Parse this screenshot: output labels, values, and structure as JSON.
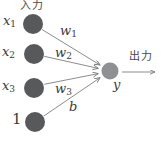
{
  "diagram": {
    "title_semantics": "perceptron neuron diagram",
    "input_label": "入力",
    "output_label": "出力",
    "nodes": [
      {
        "id": "x1",
        "base": "x",
        "sub": "1"
      },
      {
        "id": "x2",
        "base": "x",
        "sub": "2"
      },
      {
        "id": "x3",
        "base": "x",
        "sub": "3"
      },
      {
        "id": "bias-input",
        "base": "1",
        "sub": ""
      },
      {
        "id": "y",
        "base": "y",
        "sub": ""
      }
    ],
    "edge_labels": [
      {
        "id": "w1",
        "base": "w",
        "sub": "1"
      },
      {
        "id": "w2",
        "base": "w",
        "sub": "2"
      },
      {
        "id": "w3",
        "base": "w",
        "sub": "3"
      },
      {
        "id": "b",
        "base": "b",
        "sub": ""
      }
    ],
    "colors": {
      "input_node": "#58595b",
      "output_node": "#8f9093",
      "edge": "#8c8d8f",
      "arrowhead": "#7a7b7d",
      "text": "#3a3a3c"
    }
  }
}
